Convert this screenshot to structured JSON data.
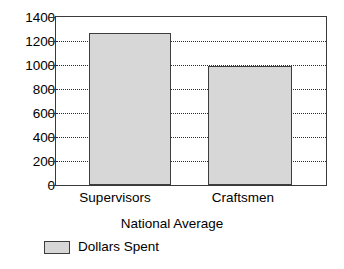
{
  "chart_data": {
    "type": "bar",
    "title": "",
    "subtitle": "",
    "categories": [
      "Supervisors",
      "Craftsmen"
    ],
    "values": [
      1270,
      990
    ],
    "series": [
      {
        "name": "Dollars Spent",
        "values": [
          1270,
          990
        ],
        "color": "#d7d7d7"
      }
    ],
    "xlabel": "National Average",
    "ylabel": "",
    "ylim": [
      0,
      1400
    ],
    "ytick_labels": [
      "1400",
      "1200",
      "1000",
      "800",
      "600",
      "400",
      "200",
      "0"
    ],
    "ytick_values": [
      1400,
      1200,
      1000,
      800,
      600,
      400,
      200,
      0
    ],
    "ytick_step": 200,
    "grid": true,
    "grid_style": "dotted",
    "grid_color": "#2b2b2b",
    "legend": {
      "position": "bottom-left",
      "entries": [
        {
          "label": "Dollars Spent",
          "color": "#d7d7d7"
        }
      ]
    },
    "frame_color": "#3a3a3a",
    "background": "#ffffff"
  }
}
